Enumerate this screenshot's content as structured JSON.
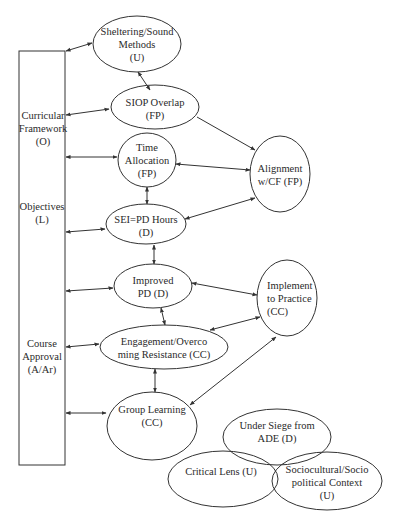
{
  "diagram": {
    "sidebar_box": {
      "labels": [
        {
          "id": "curricular",
          "text": "Curricular\nFramework\n(O)"
        },
        {
          "id": "objectives",
          "text": "Objectives\n(L)"
        },
        {
          "id": "course",
          "text": "Course\nApproval\n(A/Ar)"
        }
      ]
    },
    "nodes": [
      {
        "id": "sheltering",
        "text": "Sheltering/Sound\nMethods\n(U)"
      },
      {
        "id": "siop",
        "text": "SIOP Overlap\n(FP)"
      },
      {
        "id": "time",
        "text": "Time\nAllocation\n(FP)"
      },
      {
        "id": "alignment",
        "text": "Alignment\nw/CF (FP)"
      },
      {
        "id": "sei",
        "text": "SEI=PD Hours\n(D)"
      },
      {
        "id": "improved",
        "text": "Improved\nPD (D)"
      },
      {
        "id": "implement",
        "text": "Implement\nto Practice\n(CC)"
      },
      {
        "id": "engagement",
        "text": "Engagement/Overco\nming Resistance (CC)"
      },
      {
        "id": "group",
        "text": "Group Learning\n(CC)"
      },
      {
        "id": "siege",
        "text": "Under Siege from\nADE (D)"
      },
      {
        "id": "critical",
        "text": "Critical Lens (U)"
      },
      {
        "id": "sociocultural",
        "text": "Sociocultural/Socio\npolitical Context\n(U)"
      }
    ],
    "edges": [
      {
        "from": "box",
        "to": "sheltering",
        "type": "bidirectional"
      },
      {
        "from": "box",
        "to": "siop",
        "type": "bidirectional"
      },
      {
        "from": "box",
        "to": "time",
        "type": "bidirectional"
      },
      {
        "from": "box",
        "to": "sei",
        "type": "bidirectional"
      },
      {
        "from": "box",
        "to": "improved",
        "type": "bidirectional"
      },
      {
        "from": "box",
        "to": "engagement",
        "type": "bidirectional"
      },
      {
        "from": "box",
        "to": "group",
        "type": "bidirectional"
      },
      {
        "from": "sheltering",
        "to": "siop",
        "type": "bidirectional"
      },
      {
        "from": "siop",
        "to": "alignment",
        "type": "directed"
      },
      {
        "from": "time",
        "to": "alignment",
        "type": "bidirectional"
      },
      {
        "from": "alignment",
        "to": "sei",
        "type": "bidirectional"
      },
      {
        "from": "time",
        "to": "sei",
        "type": "bidirectional"
      },
      {
        "from": "sei",
        "to": "improved",
        "type": "bidirectional"
      },
      {
        "from": "improved",
        "to": "implement",
        "type": "bidirectional"
      },
      {
        "from": "improved",
        "to": "engagement",
        "type": "bidirectional"
      },
      {
        "from": "implement",
        "to": "engagement",
        "type": "bidirectional"
      },
      {
        "from": "engagement",
        "to": "group",
        "type": "bidirectional"
      },
      {
        "from": "group",
        "to": "implement",
        "type": "bidirectional"
      }
    ],
    "colors": {
      "stroke": "#333333",
      "text": "#2a2a2a",
      "background": "#ffffff"
    }
  }
}
